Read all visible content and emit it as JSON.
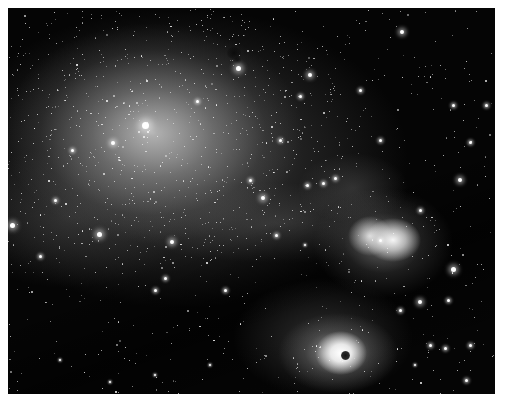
{
  "image": {
    "description": "Grayscale astronomical photograph of a dense star field with a bright star cloud at upper left and two glowing emission nebulae at lower right, one containing a small dark globule",
    "frame": {
      "background": "#ffffff",
      "sky": "#050505"
    },
    "regions": [
      {
        "name": "star-cloud",
        "cx": 145,
        "cy": 125
      },
      {
        "name": "upper-nebula",
        "cx": 378,
        "cy": 232
      },
      {
        "name": "lower-nebula",
        "cx": 333,
        "cy": 345
      }
    ],
    "bright_stars": [
      [
        145,
        125,
        7
      ],
      [
        99,
        234,
        5
      ],
      [
        238,
        68,
        5
      ],
      [
        113,
        143,
        4
      ],
      [
        263,
        198,
        4
      ],
      [
        172,
        242,
        4
      ],
      [
        402,
        32,
        4
      ],
      [
        310,
        75,
        4
      ],
      [
        380,
        240,
        3
      ],
      [
        453,
        269,
        5
      ],
      [
        420,
        302,
        4
      ],
      [
        460,
        180,
        4
      ],
      [
        453,
        105,
        3
      ],
      [
        486,
        105,
        3
      ],
      [
        12,
        225,
        5
      ],
      [
        335,
        178,
        3
      ],
      [
        307,
        185,
        3
      ],
      [
        323,
        183,
        3
      ],
      [
        197,
        101,
        3
      ],
      [
        300,
        96,
        3
      ],
      [
        448,
        300,
        3
      ],
      [
        470,
        142,
        3
      ],
      [
        400,
        310,
        3
      ],
      [
        470,
        345,
        3
      ],
      [
        466,
        380,
        3
      ],
      [
        165,
        278,
        3
      ],
      [
        155,
        290,
        3
      ],
      [
        40,
        256,
        3
      ],
      [
        55,
        200,
        3
      ],
      [
        72,
        150,
        3
      ],
      [
        225,
        290,
        3
      ],
      [
        250,
        180,
        3
      ],
      [
        280,
        140,
        3
      ],
      [
        360,
        90,
        3
      ],
      [
        380,
        140,
        3
      ],
      [
        420,
        210,
        3
      ],
      [
        60,
        360,
        2
      ],
      [
        110,
        382,
        2
      ],
      [
        210,
        365,
        2
      ],
      [
        155,
        375,
        2
      ],
      [
        430,
        345,
        3
      ],
      [
        445,
        348,
        3
      ],
      [
        415,
        365,
        2
      ],
      [
        276,
        235,
        3
      ],
      [
        305,
        245,
        2
      ]
    ],
    "faint_star_seed": 7331,
    "faint_star_count": 1400
  }
}
